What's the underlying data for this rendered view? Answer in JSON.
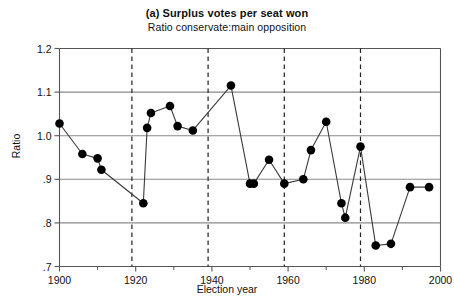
{
  "chart_data": {
    "type": "line",
    "title": "(a) Surplus votes per seat won",
    "subtitle": "Ratio conservate:main opposition",
    "xlabel": "Election year",
    "ylabel": "Ratio",
    "xlim": [
      1900,
      2000
    ],
    "ylim": [
      0.7,
      1.2
    ],
    "grid": "horizontal",
    "legend": "none",
    "xticks": [
      1900,
      1920,
      1940,
      1960,
      1980,
      2000
    ],
    "xticklabels": [
      "1900",
      "1920",
      "1940",
      "1960",
      "1980",
      "2000"
    ],
    "xminorticks": [
      1910,
      1930,
      1950,
      1970,
      1990
    ],
    "yticks": [
      0.7,
      0.8,
      0.9,
      1.0,
      1.1,
      1.2
    ],
    "yticklabels": [
      ".7",
      ".8",
      ".9",
      "1.0",
      "1.1",
      "1.2"
    ],
    "vlines": [
      1919,
      1939,
      1959,
      1979
    ],
    "marker": "filled-circle",
    "series": [
      {
        "name": "Ratio conservative:main opposition",
        "x": [
          1900,
          1906,
          1910,
          1911,
          1922,
          1923,
          1924,
          1929,
          1931,
          1935,
          1945,
          1950,
          1951,
          1955,
          1959,
          1964,
          1966,
          1970,
          1974,
          1975,
          1979,
          1983,
          1987,
          1992,
          1997
        ],
        "values": [
          1.028,
          0.958,
          0.948,
          0.922,
          0.845,
          1.018,
          1.052,
          1.068,
          1.022,
          1.012,
          1.115,
          0.89,
          0.89,
          0.945,
          0.89,
          0.9,
          0.967,
          1.032,
          0.845,
          0.812,
          0.975,
          0.748,
          0.752,
          0.882,
          0.882
        ]
      }
    ]
  },
  "axis": {
    "y_tick_0": "1.2",
    "y_tick_1": "1.1",
    "y_tick_2": "1.0",
    "y_tick_3": ".9",
    "y_tick_4": ".8",
    "y_tick_5": ".7",
    "x_tick_0": "1900",
    "x_tick_1": "1920",
    "x_tick_2": "1940",
    "x_tick_3": "1960",
    "x_tick_4": "1980",
    "x_tick_5": "2000"
  },
  "style": {
    "line_color": "#3a3a3a",
    "marker_color": "#000000",
    "grid_color": "#8a8a8a",
    "axis_color": "#555555",
    "vline_color": "#222222"
  }
}
